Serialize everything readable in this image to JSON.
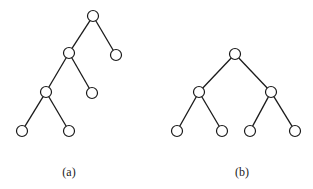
{
  "diagrams": [
    {
      "id": "a",
      "caption": "(a)",
      "description": "Left-skewed binary tree with 7 nodes",
      "nodes": [
        "root",
        "l",
        "r",
        "ll",
        "lr",
        "lll",
        "llr"
      ],
      "edges": [
        [
          "root",
          "l"
        ],
        [
          "root",
          "r"
        ],
        [
          "l",
          "ll"
        ],
        [
          "l",
          "lr"
        ],
        [
          "ll",
          "lll"
        ],
        [
          "ll",
          "llr"
        ]
      ]
    },
    {
      "id": "b",
      "caption": "(b)",
      "description": "Complete binary tree with 7 nodes",
      "nodes": [
        "root",
        "l",
        "r",
        "ll",
        "lr",
        "rl",
        "rr"
      ],
      "edges": [
        [
          "root",
          "l"
        ],
        [
          "root",
          "r"
        ],
        [
          "l",
          "ll"
        ],
        [
          "l",
          "lr"
        ],
        [
          "r",
          "rl"
        ],
        [
          "r",
          "rr"
        ]
      ]
    }
  ]
}
